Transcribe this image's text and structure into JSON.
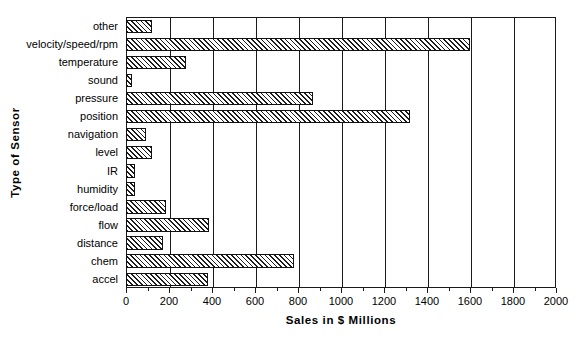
{
  "chart_data": {
    "type": "bar",
    "orientation": "horizontal",
    "title": "",
    "xlabel": "Sales in $ Millions",
    "ylabel": "Type of Sensor",
    "xlim": [
      0,
      2000
    ],
    "xticks": [
      0,
      200,
      400,
      600,
      800,
      1000,
      1200,
      1400,
      1600,
      1800,
      2000
    ],
    "xtick_labels": [
      "0",
      "200",
      "400",
      "600",
      "800",
      "1000",
      "1200",
      "1400",
      "1600",
      "1800",
      "2000"
    ],
    "grid": "vertical",
    "legend": "none",
    "bar_style": {
      "fill": "diagonal-hatch",
      "edge_color": "#111111",
      "face_color": "#ffffff"
    },
    "categories": [
      "other",
      "velocity/speed/rpm",
      "temperature",
      "sound",
      "pressure",
      "position",
      "navigation",
      "level",
      "IR",
      "humidity",
      "force/load",
      "flow",
      "distance",
      "chem",
      "accel"
    ],
    "values": [
      120,
      1600,
      280,
      30,
      870,
      1320,
      95,
      122,
      40,
      40,
      185,
      385,
      170,
      780,
      380
    ],
    "series": [
      {
        "name": "Sales in $ Millions",
        "values": [
          120,
          1600,
          280,
          30,
          870,
          1320,
          95,
          122,
          40,
          40,
          185,
          385,
          170,
          780,
          380
        ]
      }
    ],
    "points": [
      {
        "category": "other",
        "value": 120
      },
      {
        "category": "velocity/speed/rpm",
        "value": 1600
      },
      {
        "category": "temperature",
        "value": 280
      },
      {
        "category": "sound",
        "value": 30
      },
      {
        "category": "pressure",
        "value": 870
      },
      {
        "category": "position",
        "value": 1320
      },
      {
        "category": "navigation",
        "value": 95
      },
      {
        "category": "level",
        "value": 122
      },
      {
        "category": "IR",
        "value": 40
      },
      {
        "category": "humidity",
        "value": 40
      },
      {
        "category": "force/load",
        "value": 185
      },
      {
        "category": "flow",
        "value": 385
      },
      {
        "category": "distance",
        "value": 170
      },
      {
        "category": "chem",
        "value": 780
      },
      {
        "category": "accel",
        "value": 380
      }
    ]
  }
}
